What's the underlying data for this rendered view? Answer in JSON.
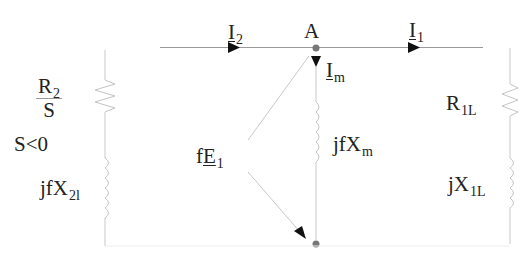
{
  "diagram": {
    "type": "equivalent-circuit",
    "colors": {
      "wire": "#c8c8c8",
      "arrow": "#111111",
      "node": "#777777",
      "text": "#222222"
    },
    "currents": {
      "i2": {
        "main": "I",
        "sub": "2"
      },
      "i1": {
        "main": "I",
        "sub": "1"
      },
      "im": {
        "main": "I",
        "sub": "m"
      }
    },
    "node_label": "A",
    "left_branch": {
      "resistor": {
        "numerator_main": "R",
        "numerator_sub": "2",
        "denominator": "S"
      },
      "condition": "S<0",
      "inductor": {
        "main": "jfX",
        "sub": "2l"
      }
    },
    "middle_branch": {
      "inductor": {
        "main": "jfX",
        "sub": "m"
      },
      "voltage": {
        "prefix": "f",
        "main": "E",
        "sub": "1"
      }
    },
    "right_branch": {
      "resistor": {
        "main": "R",
        "sub": "1L"
      },
      "inductor": {
        "main": "jX",
        "sub": "1L"
      }
    }
  }
}
